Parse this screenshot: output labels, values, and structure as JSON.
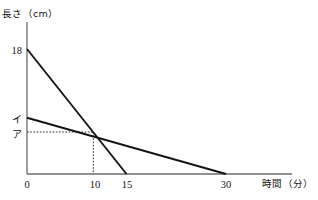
{
  "chart_data": {
    "type": "line",
    "title": "",
    "xlabel": "時間（分）",
    "ylabel": "長さ（cm）",
    "xlim": [
      0,
      40
    ],
    "ylim": [
      0,
      21.5
    ],
    "grid": false,
    "legend": null,
    "x_ticks": [
      {
        "label": "0",
        "value": 0
      },
      {
        "label": "10",
        "value": 10
      },
      {
        "label": "15",
        "value": 15
      },
      {
        "label": "30",
        "value": 30
      }
    ],
    "y_ticks": [
      {
        "label": "18",
        "value": 18
      },
      {
        "label": "イ",
        "value": 8.1
      },
      {
        "label": "ア",
        "value": 6.05
      }
    ],
    "series": [
      {
        "name": "steep-line",
        "points": [
          [
            0,
            18
          ],
          [
            15,
            0
          ]
        ]
      },
      {
        "name": "shallow-line",
        "points": [
          [
            0,
            8.1
          ],
          [
            30,
            0
          ]
        ]
      }
    ],
    "annotations": [
      {
        "name": "intersection-guides",
        "type": "dashed-guides",
        "x": 10,
        "y": 6.05,
        "x_label": "10",
        "y_label": "ア"
      }
    ]
  },
  "axes": {
    "y_axis_label": "長さ（cm）",
    "x_axis_label": "時間（分）"
  },
  "labels": {
    "y_18": "18",
    "y_i": "イ",
    "y_a": "ア",
    "x_0": "0",
    "x_10": "10",
    "x_15": "15",
    "x_30": "30"
  },
  "colors": {
    "line": "#141414",
    "axis": "#6b6b6b",
    "text": "#141414",
    "background": "#ffffff"
  }
}
